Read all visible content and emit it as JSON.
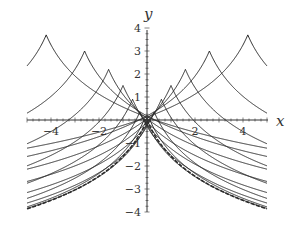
{
  "chart_data": {
    "type": "line",
    "title": "",
    "xlabel": "x",
    "ylabel": "y",
    "xlim": [
      -5,
      5
    ],
    "ylim": [
      -4,
      4
    ],
    "x_ticks": [
      -4,
      -2,
      2,
      4
    ],
    "y_ticks": [
      -4,
      -3,
      -2,
      -1,
      1,
      2,
      3,
      4
    ],
    "x_tick_labels": [
      "−4",
      "−2",
      "2",
      "4"
    ],
    "y_tick_labels": [
      "−4",
      "−3",
      "−2",
      "−1",
      "1",
      "2",
      "3",
      "4"
    ],
    "grid": false,
    "legend": null,
    "series": [
      {
        "name": "cusp a=0 (envelope)",
        "shift": 0.0,
        "height": 0.0,
        "dashed": true
      },
      {
        "name": "a=0.1",
        "shift": 0.1,
        "height": 0.05
      },
      {
        "name": "a=-0.1",
        "shift": -0.1,
        "height": 0.05
      },
      {
        "name": "a=0.3",
        "shift": 0.3,
        "height": 0.35
      },
      {
        "name": "a=-0.3",
        "shift": -0.3,
        "height": 0.35
      },
      {
        "name": "a=0.6",
        "shift": 0.6,
        "height": 0.9
      },
      {
        "name": "a=-0.6",
        "shift": -0.6,
        "height": 0.9
      },
      {
        "name": "a=1.0",
        "shift": 1.0,
        "height": 1.5
      },
      {
        "name": "a=-1.0",
        "shift": -1.0,
        "height": 1.5
      },
      {
        "name": "a=1.6",
        "shift": 1.6,
        "height": 2.2
      },
      {
        "name": "a=-1.6",
        "shift": -1.6,
        "height": 2.2
      },
      {
        "name": "a=2.6",
        "shift": 2.6,
        "height": 3.0
      },
      {
        "name": "a=-2.6",
        "shift": -2.6,
        "height": 3.0
      },
      {
        "name": "a=4.2",
        "shift": 4.2,
        "height": 3.7
      },
      {
        "name": "a=-4.2",
        "shift": -4.2,
        "height": 3.7
      }
    ]
  },
  "axes": {
    "x_label": "x",
    "y_label": "y"
  }
}
